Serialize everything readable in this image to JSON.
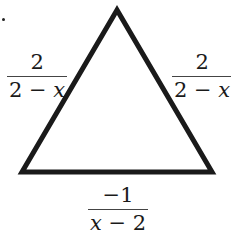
{
  "diagram": {
    "shape": "triangle",
    "vertices": {
      "top": [
        117,
        10
      ],
      "bottom_left": [
        22,
        172
      ],
      "bottom_right": [
        212,
        172
      ]
    },
    "stroke_color": "#1a1a1a",
    "stroke_width": 5,
    "fill": "#ffffff"
  },
  "labels": {
    "left_side": {
      "numerator": "2",
      "denominator_const": "2 − ",
      "denominator_var": "x"
    },
    "right_side": {
      "numerator": "2",
      "denominator_const": "2 − ",
      "denominator_var": "x"
    },
    "bottom_side": {
      "numerator": "−1",
      "denominator_var": "x",
      "denominator_const": " − 2"
    }
  },
  "marker": {
    "type": "dot"
  }
}
